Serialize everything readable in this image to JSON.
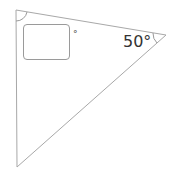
{
  "diagram": {
    "type": "right-triangle-angle-problem",
    "vertices": {
      "top_left": [
        16,
        10
      ],
      "right": [
        166,
        35
      ],
      "bottom": [
        17,
        167
      ]
    },
    "known_angle": {
      "label": "50°",
      "value": 50,
      "vertex": "right"
    },
    "unknown_angle": {
      "vertex": "top_left",
      "input_value": "",
      "unit_label": "°"
    },
    "colors": {
      "line": "#9a9a9a",
      "text": "#333333"
    }
  }
}
